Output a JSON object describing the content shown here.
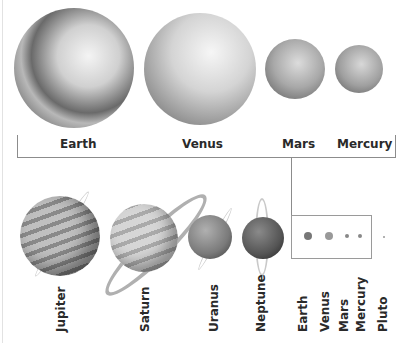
{
  "top_group": {
    "planets": [
      {
        "name": "Earth"
      },
      {
        "name": "Venus"
      },
      {
        "name": "Mars"
      },
      {
        "name": "Mercury"
      }
    ]
  },
  "bottom_group": {
    "planets": [
      {
        "name": "Jupiter"
      },
      {
        "name": "Saturn"
      },
      {
        "name": "Uranus"
      },
      {
        "name": "Neptune"
      }
    ],
    "inset_labels": [
      {
        "name": "Earth"
      },
      {
        "name": "Venus"
      },
      {
        "name": "Mars"
      },
      {
        "name": "Mercury"
      },
      {
        "name": "Pluto"
      }
    ]
  },
  "colors": {
    "line": "#8c8c8c",
    "text": "#2a2a2a"
  }
}
